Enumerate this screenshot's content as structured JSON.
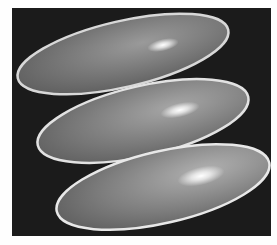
{
  "image": {
    "description": "Three glossy elongated ellipsoids stacked diagonally on a black background",
    "background_color": "#1b1b1b",
    "border_color": "#fefefe",
    "ellipsoids": [
      {
        "cx": 123,
        "cy": 54,
        "rx": 108,
        "ry": 34,
        "rotate": -13,
        "highlight": [
          163,
          45
        ]
      },
      {
        "cx": 143,
        "cy": 121,
        "rx": 108,
        "ry": 35,
        "rotate": -13,
        "highlight": [
          180,
          110
        ]
      },
      {
        "cx": 163,
        "cy": 187,
        "rx": 109,
        "ry": 36,
        "rotate": -13,
        "highlight": [
          201,
          176
        ]
      }
    ]
  }
}
